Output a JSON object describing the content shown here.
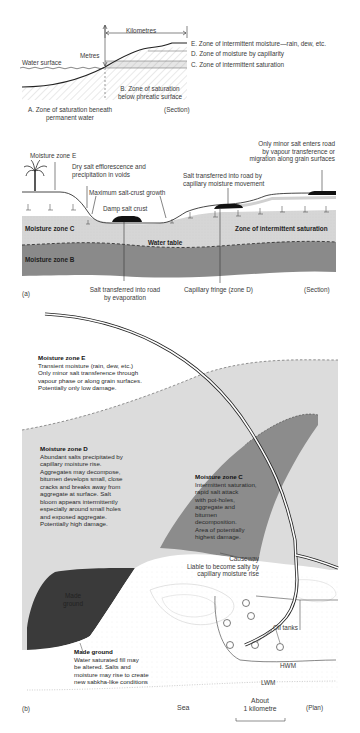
{
  "figure_a_top": {
    "kilometres": "Kilometres",
    "metres": "Metres",
    "water_surface": "Water surface",
    "zone_e": "E. Zone of intermittent moisture—rain, dew, etc.",
    "zone_d": "D. Zone of moisture by capillarity",
    "zone_c": "C. Zone of intermittent saturation",
    "zone_b": [
      "B. Zone of saturation",
      "below phreatic surface"
    ],
    "zone_a": [
      "A. Zone of saturation beneath",
      "permanent water"
    ],
    "section": "(Section)"
  },
  "figure_a": {
    "panel_label": "(a)",
    "moisture_zone_e": "Moisture zone E",
    "dry_salt": [
      "Dry salt efflorescence and",
      "precipitation in voids"
    ],
    "max_salt_crust": "Maximum salt-crust growth",
    "damp_salt_crust": "Damp salt crust",
    "salt_capillary": [
      "Salt transferred into road by",
      "capillary moisture movement"
    ],
    "only_minor": [
      "Only minor salt enters road",
      "by vapour transference or",
      "migration along grain surfaces"
    ],
    "moisture_zone_c": "Moisture zone C",
    "zone_intermittent": "Zone of intermittent saturation",
    "water_table": "Water table",
    "moisture_zone_b": "Moisture zone B",
    "salt_evaporation": [
      "Salt transferred into road",
      "by evaporation"
    ],
    "capillary_fringe": "Capillary fringe (zone D)",
    "section": "(Section)"
  },
  "figure_b": {
    "panel_label": "(b)",
    "zone_e": {
      "title": "Moisture zone E",
      "lines": [
        "Transient moisture (rain, dew, etc.)",
        "Only minor salt transference through",
        "vapour phase or along grain surfaces.",
        "Potentially only low damage."
      ]
    },
    "zone_d": {
      "title": "Moisture zone D",
      "lines": [
        "Abundant salts precipitated by",
        "capillary moisture rise.",
        "Aggregates may decompose,",
        "bitumen develops small, close",
        "cracks and breaks away from",
        "aggregate at surface.  Salt",
        "bloom appears intermittently",
        "especially around small holes",
        "and exposed aggregate.",
        "Potentially high damage."
      ]
    },
    "zone_c": {
      "title": "Moisture zone C",
      "lines": [
        "Intermittent saturation,",
        "rapid salt attack",
        "with pot-holes,",
        "aggregate and",
        "bitumen",
        "decomposition.",
        "Area of potentially",
        "highest damage."
      ]
    },
    "made_ground_area": [
      "Made",
      "ground"
    ],
    "made_ground": {
      "title": "Made ground",
      "lines": [
        "Water saturated fill may",
        "be altered.  Salts and",
        "moisture may rise to create",
        "new sabkha-like conditions"
      ]
    },
    "causeway": [
      "Causeway",
      "Liable to become salty by",
      "capillary moisture rise"
    ],
    "oil_tanks": "Oil tanks",
    "hwm": "HWM",
    "lwm": "LWM",
    "sea": "Sea",
    "scale": [
      "About",
      "1 kilometre"
    ],
    "plan": "(Plan)"
  },
  "colors": {
    "zone_e_fill": "#dedede",
    "zone_c_fill": "#8c8c8c",
    "made_ground_fill": "#3a3a3a",
    "moisture_zone_b": "#8a8a8a",
    "moisture_zone_c": "#d4d4d4",
    "road": "#111111"
  }
}
